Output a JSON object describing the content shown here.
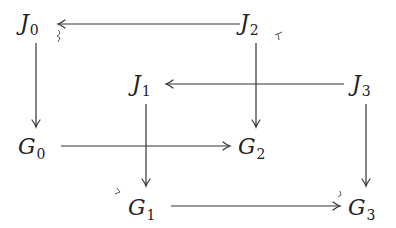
{
  "diagram": {
    "type": "commutative-diagram",
    "nodes": [
      {
        "id": "J0",
        "base": "J",
        "sub": "0",
        "x": 35,
        "y": 20
      },
      {
        "id": "J2",
        "base": "J",
        "sub": "2",
        "x": 255,
        "y": 20
      },
      {
        "id": "J1",
        "base": "J",
        "sub": "1",
        "x": 145,
        "y": 83
      },
      {
        "id": "J3",
        "base": "J",
        "sub": "3",
        "x": 365,
        "y": 83
      },
      {
        "id": "G0",
        "base": "G",
        "sub": "0",
        "x": 35,
        "y": 148
      },
      {
        "id": "G2",
        "base": "G",
        "sub": "2",
        "x": 255,
        "y": 148
      },
      {
        "id": "G1",
        "base": "G",
        "sub": "1",
        "x": 145,
        "y": 210
      },
      {
        "id": "G3",
        "base": "G",
        "sub": "3",
        "x": 365,
        "y": 210
      }
    ],
    "edges": [
      {
        "from": "J2",
        "to": "J0"
      },
      {
        "from": "J0",
        "to": "G0"
      },
      {
        "from": "J2",
        "to": "G2"
      },
      {
        "from": "J3",
        "to": "J1"
      },
      {
        "from": "J1",
        "to": "G1"
      },
      {
        "from": "J3",
        "to": "G3"
      },
      {
        "from": "G0",
        "to": "G2"
      },
      {
        "from": "G1",
        "to": "G3"
      }
    ]
  }
}
